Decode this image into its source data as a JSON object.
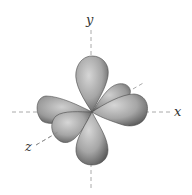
{
  "diagram": {
    "type": "d-orbital",
    "axes": {
      "x_label": "x",
      "y_label": "y",
      "z_label": "z"
    },
    "colors": {
      "lobe_light": "#c8c8c8",
      "lobe_dark": "#5a5a5a",
      "axis": "#9a9a9a",
      "label": "#333333"
    }
  }
}
